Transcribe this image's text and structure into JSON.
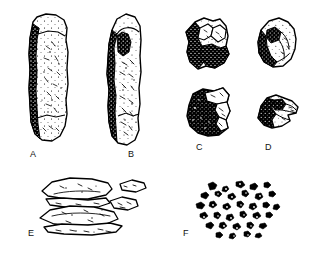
{
  "figure": {
    "kind": "scientific-specimen-plate",
    "background_color": "#ffffff",
    "ink_color": "#000000",
    "width": 321,
    "height": 254,
    "panel_count": 6
  },
  "panels": [
    {
      "id": "A",
      "label": "A",
      "name": "elongated-columnar-clast",
      "description": "Tall narrow columnar rock fragment with dark stippled left margin and light mottled face",
      "label_x": 30,
      "label_y": 150,
      "shape_x": 22,
      "shape_y": 12,
      "shape_w": 56,
      "shape_h": 132
    },
    {
      "id": "B",
      "label": "B",
      "name": "rounded-columnar-clast",
      "description": "Tall rounded-top columnar rock fragment with heavy dark stipple along left edge",
      "label_x": 128,
      "label_y": 150,
      "shape_x": 98,
      "shape_y": 12,
      "shape_w": 52,
      "shape_h": 136
    },
    {
      "id": "top-right-1",
      "label": "",
      "name": "angular-fragment-upper-left",
      "description": "Angular blocky rock fragment, upper right quadrant, left side densely stippled",
      "label_x": null,
      "label_y": null,
      "shape_x": 182,
      "shape_y": 16,
      "shape_w": 50,
      "shape_h": 58
    },
    {
      "id": "top-right-2",
      "label": "",
      "name": "rounded-fragment-upper-right",
      "description": "Rounded lumpy rock fragment, upper right corner, stippled lower-left margin",
      "label_x": null,
      "label_y": null,
      "shape_x": 253,
      "shape_y": 16,
      "shape_w": 48,
      "shape_h": 56
    },
    {
      "id": "C",
      "label": "C",
      "name": "blocky-dark-clast",
      "description": "Blocky rock fragment with very dark stippled body and pale fractured upper-right facet",
      "label_x": 196,
      "label_y": 143,
      "shape_x": 181,
      "shape_y": 86,
      "shape_w": 52,
      "shape_h": 54
    },
    {
      "id": "D",
      "label": "D",
      "name": "wedge-shaped-clast",
      "description": "Small wedge-shaped rock fragment tapering to the right with dark stipple on the left",
      "label_x": 265,
      "label_y": 143,
      "shape_x": 252,
      "shape_y": 92,
      "shape_w": 50,
      "shape_h": 44
    },
    {
      "id": "E",
      "label": "E",
      "name": "flat-platy-flakes",
      "description": "Cluster of thin flat overlapping platy flakes drawn in outline with light interior detail",
      "label_x": 28,
      "label_y": 229,
      "shape_x": 36,
      "shape_y": 174,
      "shape_w": 112,
      "shape_h": 66
    },
    {
      "id": "F",
      "label": "F",
      "name": "scattered-granule-fragments",
      "description": "Loose scatter of many small dark irregular granules and chips",
      "label_x": 183,
      "label_y": 229,
      "shape_x": 190,
      "shape_y": 178,
      "shape_w": 95,
      "shape_h": 62
    }
  ]
}
